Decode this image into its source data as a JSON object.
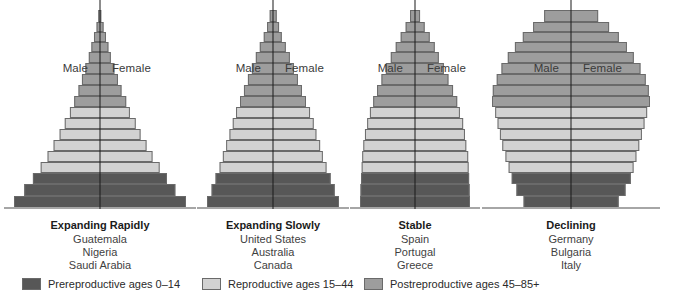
{
  "figure": {
    "type": "population-pyramid-set",
    "male_label": "Male",
    "female_label": "Female"
  },
  "colors": {
    "prereproductive": "#575757",
    "reproductive": "#d2d2d2",
    "postreproductive": "#9d9d9d",
    "axis": "#1b1b1b",
    "baseline": "#a6a6a6",
    "background": "#ffffff"
  },
  "legend": [
    {
      "key": "prereproductive",
      "label": "Prereproductive ages 0–14",
      "color": "#575757",
      "x": 22
    },
    {
      "key": "reproductive",
      "label": "Reproductive ages 15–44",
      "color": "#d2d2d2",
      "x": 202
    },
    {
      "key": "postreproductive",
      "label": "Postreproductive ages 45–85+",
      "color": "#9d9d9d",
      "x": 364
    }
  ],
  "age_groups": [
    "0–4",
    "5–9",
    "10–14",
    "15–19",
    "20–24",
    "25–29",
    "30–34",
    "35–39",
    "40–44",
    "45–49",
    "50–54",
    "55–59",
    "60–64",
    "65–69",
    "70–74",
    "75–79",
    "80–84",
    "85+"
  ],
  "band_classes": [
    "prereproductive",
    "prereproductive",
    "prereproductive",
    "reproductive",
    "reproductive",
    "reproductive",
    "reproductive",
    "reproductive",
    "reproductive",
    "postreproductive",
    "postreproductive",
    "postreproductive",
    "postreproductive",
    "postreproductive",
    "postreproductive",
    "postreproductive",
    "postreproductive",
    "postreproductive"
  ],
  "pyramids": [
    {
      "id": "expanding-rapidly",
      "title": "Expanding Rapidly",
      "countries": [
        "Guatemala",
        "Nigeria",
        "Saudi Arabia"
      ],
      "left": 14,
      "width": 172,
      "widths": [
        100,
        88,
        78,
        69,
        61,
        54,
        47,
        41,
        35,
        30,
        25,
        21,
        17,
        13,
        10,
        7,
        4,
        2
      ],
      "heights": [
        13,
        12,
        11,
        11,
        11,
        11,
        11,
        11,
        11,
        11,
        11,
        11,
        11,
        11,
        10,
        10,
        10,
        12
      ]
    },
    {
      "id": "expanding-slowly",
      "title": "Expanding Slowly",
      "countries": [
        "United States",
        "Australia",
        "Canada"
      ],
      "left": 207,
      "width": 132,
      "widths": [
        100,
        93,
        87,
        81,
        76,
        71,
        66,
        61,
        56,
        50,
        44,
        38,
        32,
        26,
        20,
        14,
        9,
        5
      ],
      "heights": [
        13,
        12,
        11,
        11,
        11,
        11,
        11,
        11,
        11,
        11,
        11,
        11,
        11,
        11,
        10,
        10,
        10,
        12
      ]
    },
    {
      "id": "stable",
      "title": "Stable",
      "countries": [
        "Spain",
        "Portugal",
        "Greece"
      ],
      "left": 360,
      "width": 110,
      "widths": [
        100,
        99,
        98,
        97,
        96,
        94,
        91,
        87,
        82,
        76,
        69,
        61,
        53,
        44,
        35,
        26,
        17,
        9
      ],
      "heights": [
        13,
        12,
        11,
        11,
        11,
        11,
        11,
        11,
        11,
        11,
        11,
        11,
        11,
        11,
        10,
        10,
        10,
        12
      ]
    },
    {
      "id": "declining",
      "title": "Declining",
      "countries": [
        "Germany",
        "Bulgaria",
        "Italy"
      ],
      "left": 492,
      "width": 158,
      "widths": [
        60,
        69,
        75,
        79,
        83,
        87,
        90,
        93,
        96,
        100,
        99,
        94,
        88,
        80,
        71,
        61,
        48,
        34
      ],
      "heights": [
        13,
        12,
        11,
        11,
        11,
        11,
        11,
        11,
        11,
        11,
        11,
        11,
        11,
        11,
        10,
        10,
        10,
        12
      ]
    }
  ]
}
